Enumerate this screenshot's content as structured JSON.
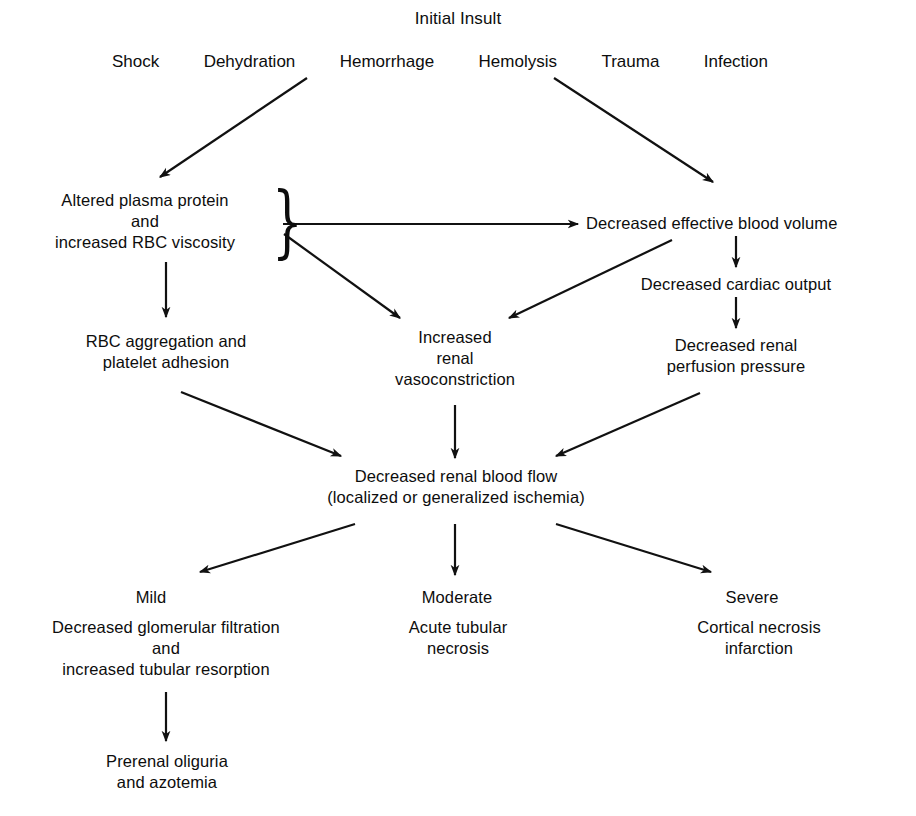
{
  "diagram": {
    "title": "Initial Insult",
    "type": "flowchart",
    "background_color": "#ffffff",
    "line_color": "#111111",
    "insults": [
      {
        "id": "shock",
        "label": "Shock"
      },
      {
        "id": "dehydration",
        "label": "Dehydration"
      },
      {
        "id": "hemorrhage",
        "label": "Hemorrhage"
      },
      {
        "id": "hemolysis",
        "label": "Hemolysis"
      },
      {
        "id": "trauma",
        "label": "Trauma"
      },
      {
        "id": "infection",
        "label": "Infection"
      }
    ],
    "nodes": {
      "altered_plasma": "Altered plasma protein\nand\nincreased RBC viscosity",
      "decreased_blood_volume": "Decreased effective blood volume",
      "rbc_aggregation": "RBC aggregation and\nplatelet adhesion",
      "increased_vasoconstriction": "Increased\nrenal\nvasoconstriction",
      "decreased_cardiac_output": "Decreased cardiac output",
      "decreased_perfusion": "Decreased renal\nperfusion pressure",
      "decreased_renal_blood_flow": "Decreased renal blood flow\n(localized or generalized ischemia)",
      "severity_mild": "Mild",
      "severity_moderate": "Moderate",
      "severity_severe": "Severe",
      "mild_outcome": "Decreased glomerular filtration\nand\nincreased tubular resorption",
      "moderate_outcome": "Acute tubular\nnecrosis",
      "severe_outcome": "Cortical necrosis\ninfarction",
      "prerenal": "Prerenal oliguria\nand azotemia"
    },
    "brace_glyph": "}"
  }
}
